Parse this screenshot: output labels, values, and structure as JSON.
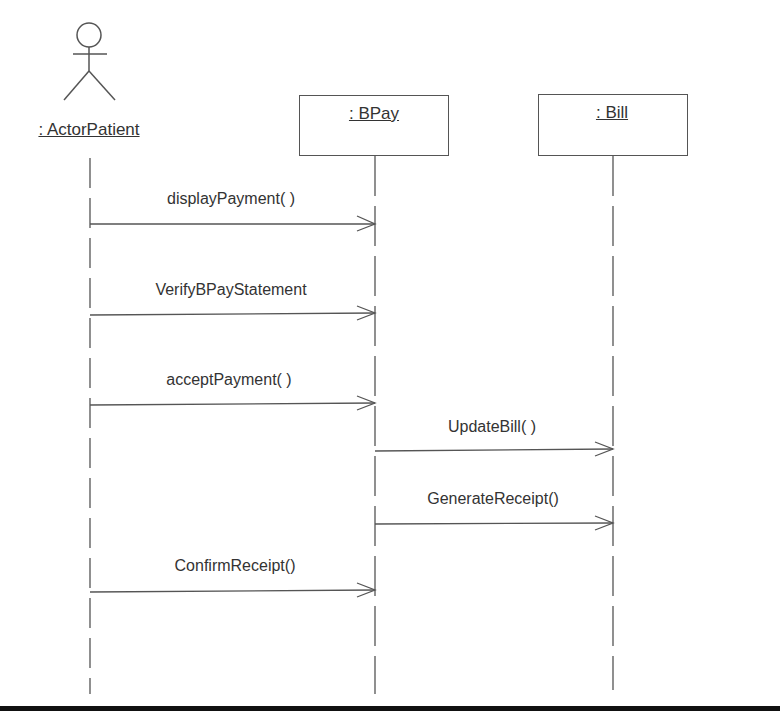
{
  "diagram": {
    "type": "UML sequence diagram",
    "participants": [
      {
        "id": "actor",
        "label": ": ActorPatient",
        "kind": "actor"
      },
      {
        "id": "bpay",
        "label": ": BPay",
        "kind": "object"
      },
      {
        "id": "bill",
        "label": ": Bill",
        "kind": "object"
      }
    ],
    "messages": [
      {
        "label": "displayPayment( )",
        "from": "actor",
        "to": "bpay"
      },
      {
        "label": "VerifyBPayStatement",
        "from": "actor",
        "to": "bpay"
      },
      {
        "label": "acceptPayment( )",
        "from": "actor",
        "to": "bpay"
      },
      {
        "label": "UpdateBill( )",
        "from": "bpay",
        "to": "bill"
      },
      {
        "label": "GenerateReceipt()",
        "from": "bpay",
        "to": "bill"
      },
      {
        "label": "ConfirmReceipt()",
        "from": "actor",
        "to": "bpay"
      }
    ],
    "colors": {
      "line": "#555555",
      "text": "#333333",
      "bottom_bar": "#111111"
    }
  }
}
